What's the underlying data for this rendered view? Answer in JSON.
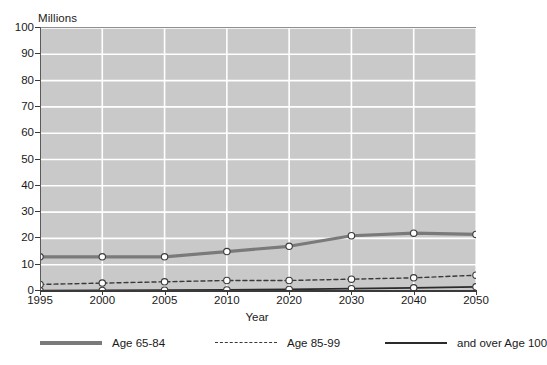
{
  "chart_data": {
    "type": "line",
    "title": "",
    "unit_label": "Millions",
    "xlabel": "Year",
    "ylabel": "",
    "categories": [
      "1995",
      "2000",
      "2005",
      "2010",
      "2020",
      "2030",
      "2040",
      "2050"
    ],
    "ylim": [
      0,
      100
    ],
    "y_ticks": [
      "0",
      "10",
      "20",
      "30",
      "40",
      "50",
      "60",
      "70",
      "80",
      "90",
      "100"
    ],
    "y_tick_values": [
      0,
      10,
      20,
      30,
      40,
      50,
      60,
      70,
      80,
      90,
      100
    ],
    "grid": "horizontal-and-vertical",
    "legend_position": "bottom",
    "series": [
      {
        "name": "Age 65-84",
        "style": "thick-solid-gray",
        "color": "#7a7a7a",
        "values": [
          13,
          13,
          13,
          15,
          17,
          21,
          22,
          21.5
        ]
      },
      {
        "name": "Age 85-99",
        "style": "dashed-black",
        "color": "#3a3a3a",
        "values": [
          2.5,
          3,
          3.5,
          4,
          4,
          4.5,
          5,
          6
        ]
      },
      {
        "name": "and over Age 100",
        "style": "thin-solid-black",
        "color": "#2b2b2b",
        "values": [
          0.1,
          0.2,
          0.3,
          0.4,
          0.6,
          0.9,
          1.2,
          1.6
        ]
      }
    ]
  },
  "colors": {
    "plot_background": "#c9c9c9",
    "gridline": "#ffffff",
    "axis": "#3a3a3a",
    "page_background": "#ffffff"
  }
}
